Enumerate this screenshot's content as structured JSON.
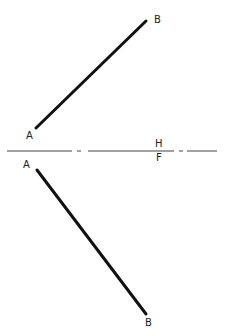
{
  "diagram": {
    "title": "",
    "labels": {
      "top_B": "B",
      "top_A": "A",
      "fold_H": "H",
      "fold_F": "F",
      "bottom_A": "A",
      "bottom_B": "B"
    },
    "lines": [
      {
        "name": "top-view-line-AB",
        "x1": 36,
        "y1": 128,
        "x2": 146,
        "y2": 21
      },
      {
        "name": "front-view-line-AB",
        "x1": 37,
        "y1": 170,
        "x2": 146,
        "y2": 314
      }
    ],
    "fold_line": {
      "y": 151,
      "x1": 7,
      "x2": 217,
      "label_above": "H",
      "label_below": "F"
    },
    "colors": {
      "line": "#111111",
      "fold": "#444444",
      "text": "#222222"
    }
  }
}
